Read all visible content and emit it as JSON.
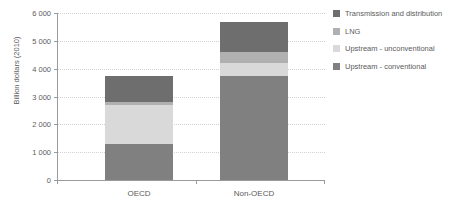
{
  "chart_data": {
    "type": "bar",
    "subtype": "stacked-vertical",
    "title": "",
    "xlabel": "",
    "ylabel": "Billion dollars (2010)",
    "categories": [
      "OECD",
      "Non-OECD"
    ],
    "ylim": [
      0,
      6000
    ],
    "ytick_values": [
      0,
      1000,
      2000,
      3000,
      4000,
      5000,
      6000
    ],
    "ytick_labels": [
      "0",
      "1 000",
      "2 000",
      "3 000",
      "4 000",
      "5 000",
      "6 000"
    ],
    "grid": true,
    "grid_style": "dotted",
    "legend_position": "right",
    "series": [
      {
        "name": "Upstream - conventional",
        "color": "#808080",
        "values": [
          1300,
          3720
        ]
      },
      {
        "name": "Upstream - unconventional",
        "color": "#d9d9d9",
        "values": [
          1380,
          480
        ]
      },
      {
        "name": "LNG",
        "color": "#b0b0b0",
        "values": [
          140,
          390
        ]
      },
      {
        "name": "Transmission and distribution",
        "color": "#6e6e6e",
        "values": [
          930,
          1090
        ]
      }
    ],
    "stack_order_bottom_to_top": [
      "Upstream - conventional",
      "Upstream - unconventional",
      "LNG",
      "Transmission and distribution"
    ],
    "legend_order_top_to_bottom": [
      "Transmission and distribution",
      "LNG",
      "Upstream - unconventional",
      "Upstream - conventional"
    ],
    "totals": [
      3750,
      5680
    ]
  },
  "legend": {
    "items": [
      {
        "label": "Transmission and distribution",
        "color": "#6e6e6e"
      },
      {
        "label": "LNG",
        "color": "#b0b0b0"
      },
      {
        "label": "Upstream - unconventional",
        "color": "#d9d9d9"
      },
      {
        "label": "Upstream - conventional",
        "color": "#808080"
      }
    ]
  },
  "axes": {
    "y_title": "Billion dollars (2010)",
    "x_categories": [
      "OECD",
      "Non-OECD"
    ]
  },
  "colors": {
    "axis": "#9a9a9a",
    "grid": "#d2d2d2",
    "text": "#5b5b5b",
    "background": "#ffffff"
  }
}
